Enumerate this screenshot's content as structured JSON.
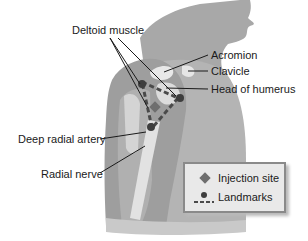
{
  "diagram": {
    "labels": {
      "deltoid_muscle": "Deltoid muscle",
      "acromion": "Acromion",
      "clavicle": "Clavicle",
      "head_of_humerus": "Head of humerus",
      "deep_radial_artery": "Deep radial artery",
      "radial_nerve": "Radial nerve"
    },
    "legend": {
      "items": [
        {
          "label": "Injection site",
          "symbol": "diamond-icon"
        },
        {
          "label": "Landmarks",
          "symbol": "dot-dashed-line-icon"
        }
      ]
    },
    "colors": {
      "skin": "#a9a9a9",
      "skin_light": "#c4c4c4",
      "bone": "#e6e6e6",
      "landmark": "#4a4a4a",
      "injection_site": "#6e6e6e",
      "leader_line": "#1a1a1a"
    }
  }
}
